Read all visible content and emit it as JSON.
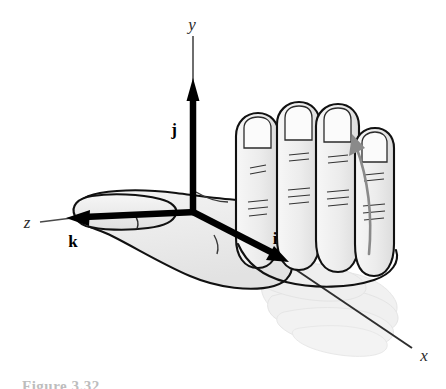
{
  "figure": {
    "background_color": "#ffffff",
    "caption_partial": "Figure 3.32",
    "axes": [
      {
        "id": "y-axis",
        "label": "y",
        "label_x": 192,
        "label_y": 30,
        "style": "italic-serif"
      },
      {
        "id": "x-axis",
        "label": "x",
        "label_x": 424,
        "label_y": 361,
        "style": "italic-serif"
      },
      {
        "id": "z-axis",
        "label": "z",
        "label_x": 27,
        "label_y": 228,
        "style": "italic-serif"
      }
    ],
    "unit_vectors": [
      {
        "id": "j-vector",
        "label": "j",
        "label_x": 174,
        "label_y": 135,
        "direction": "up (y)",
        "color": "#000000"
      },
      {
        "id": "i-vector",
        "label": "i",
        "label_x": 274,
        "label_y": 244,
        "direction": "down-right (x)",
        "color": "#000000"
      },
      {
        "id": "k-vector",
        "label": "k",
        "label_x": 72,
        "label_y": 247,
        "direction": "left (z)",
        "color": "#000000"
      }
    ],
    "origin": {
      "x": 194,
      "y": 212
    },
    "rotation_arrow": {
      "name": "curl-rotation-arrow",
      "color": "#8a8a8a",
      "from": {
        "x": 369,
        "y": 253
      },
      "to": {
        "x": 354,
        "y": 139
      },
      "meaning": "fingers curl from x toward y"
    },
    "hand": {
      "description": "Right hand, palm toward viewer, thumb pointing along z, fingers curling",
      "fill": "#ededed",
      "fill_light": "#f6f6f6",
      "outline": "#111111",
      "ghost_fill": "#f2f2f2",
      "ghost_label": "ghost-hand-prior-position"
    },
    "colors": {
      "vector_black": "#000000",
      "axis_line": "#3a3a3a",
      "rotation_grey": "#8a8a8a",
      "hand_fill": "#ededed",
      "hand_outline": "#111111",
      "ghost_grey": "#f2f2f2"
    }
  }
}
